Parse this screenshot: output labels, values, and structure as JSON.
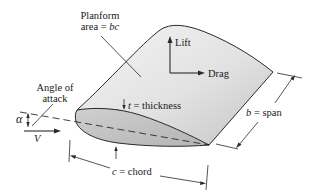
{
  "diagram": {
    "labels": {
      "planform_line1": "Planform",
      "planform_line2_prefix": "area = ",
      "planform_line2_var": "bc",
      "lift": "Lift",
      "drag": "Drag",
      "angle_line1": "Angle of",
      "angle_line2": "attack",
      "alpha": "α",
      "velocity": "V",
      "thickness_var": "t",
      "thickness_rest": " = thickness",
      "span_var": "b",
      "span_rest": " = span",
      "chord_var": "c",
      "chord_rest": " = chord"
    },
    "colors": {
      "wing_surface_light": "#f2f2f2",
      "wing_surface_dark": "#c8c8c8",
      "section_fill": "#bdbdbd",
      "outline": "#2a2a2a",
      "background": "#ffffff"
    }
  }
}
